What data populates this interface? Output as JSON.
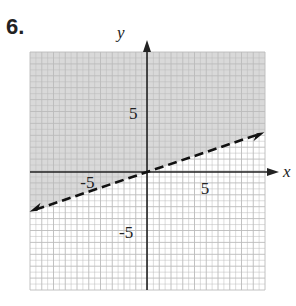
{
  "problem_number": "6.",
  "chart_data": {
    "type": "line",
    "title": "",
    "xlabel": "x",
    "ylabel": "y",
    "xlim": [
      -10,
      10
    ],
    "ylim": [
      -10,
      10
    ],
    "grid": true,
    "x_ticks_labeled": [
      "-5",
      "5"
    ],
    "y_ticks_labeled": [
      "5",
      "-5"
    ],
    "series": [
      {
        "name": "boundary",
        "style": "dashed",
        "x": [
          -10,
          10
        ],
        "y": [
          -3.33,
          3.33
        ],
        "equation": "y = x/3"
      }
    ],
    "shaded_region": "above boundary (y > x/3)",
    "shade_color": "#d9d9d9"
  }
}
